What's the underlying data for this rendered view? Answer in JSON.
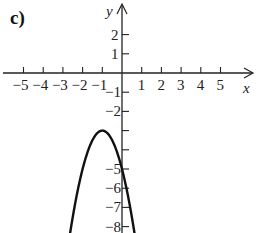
{
  "panel_label": "c)",
  "chart_data": {
    "type": "line",
    "title": "",
    "xlabel": "x",
    "ylabel": "y",
    "xlim": [
      -6,
      6.5
    ],
    "ylim": [
      -8.5,
      3.8
    ],
    "x_ticks": [
      -5,
      -4,
      -3,
      -2,
      -1,
      1,
      2,
      3,
      4,
      5
    ],
    "x_tick_labels": [
      "-5",
      "-4",
      "-3",
      "-2",
      "-1",
      "1",
      "2",
      "3",
      "4",
      "5"
    ],
    "y_ticks": [
      2,
      1,
      -1,
      -2,
      -3,
      -4,
      -5,
      -6,
      -7,
      -8
    ],
    "y_tick_labels": [
      "2",
      "1",
      "-1",
      "-2",
      "",
      "",
      "-5",
      "-6",
      "-7",
      "-8"
    ],
    "grid": false,
    "series": [
      {
        "name": "parabola",
        "equation": "y = -2(x+1)^2 - 3",
        "vertex": [
          -1,
          -3
        ],
        "x": [
          -2.7,
          -2.5,
          -2,
          -1.5,
          -1,
          -0.5,
          0,
          0.5,
          0.7
        ],
        "y": [
          -8.78,
          -7.5,
          -5,
          -3.5,
          -3,
          -3.5,
          -5,
          -7.5,
          -8.78
        ],
        "color": "#111111"
      }
    ]
  }
}
